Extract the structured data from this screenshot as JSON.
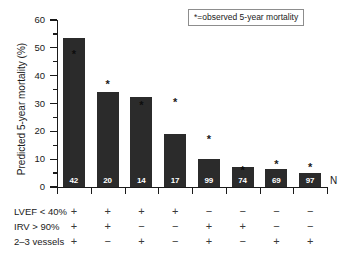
{
  "chart_data": {
    "type": "bar",
    "title": "",
    "xlabel": "",
    "ylabel": "Predicted 5-year mortality (%)",
    "ylim": [
      0,
      60
    ],
    "yticks": [
      0,
      10,
      20,
      30,
      40,
      50,
      60
    ],
    "ytick_labels": [
      "0",
      "10",
      "20",
      "30",
      "40",
      "50",
      "60"
    ],
    "yminor_step": 5,
    "grid": false,
    "legend_position": "top-right",
    "legend_text": "*=observed 5-year mortality",
    "bar_color": "#2b2b2b",
    "n_axis_label": "N",
    "categories": [
      "1",
      "2",
      "3",
      "4",
      "5",
      "6",
      "7",
      "8"
    ],
    "values": [
      53.5,
      34.0,
      32.3,
      19.0,
      10.0,
      7.2,
      6.3,
      5.0
    ],
    "observed": [
      48.0,
      37.2,
      29.8,
      31.0,
      17.5,
      6.5,
      8.5,
      7.5
    ],
    "n_counts": [
      "42",
      "20",
      "14",
      "17",
      "99",
      "74",
      "69",
      "97"
    ],
    "series": [
      {
        "name": "Predicted 5-year mortality (%)",
        "values": [
          53.5,
          34.0,
          32.3,
          19.0,
          10.0,
          7.2,
          6.3,
          5.0
        ]
      },
      {
        "name": "Observed 5-year mortality (%)",
        "values": [
          48.0,
          37.2,
          29.8,
          31.0,
          17.5,
          6.5,
          8.5,
          7.5
        ]
      }
    ],
    "marker_symbol": "*",
    "factor_rows": [
      {
        "label": "LVEF < 40%",
        "signs": [
          "+",
          "+",
          "+",
          "+",
          "−",
          "−",
          "−",
          "−"
        ]
      },
      {
        "label": "IRV > 90%",
        "signs": [
          "+",
          "+",
          "−",
          "−",
          "+",
          "+",
          "−",
          "−"
        ]
      },
      {
        "label": "2–3 vessels",
        "signs": [
          "+",
          "−",
          "+",
          "−",
          "+",
          "−",
          "+",
          "+"
        ]
      }
    ]
  }
}
